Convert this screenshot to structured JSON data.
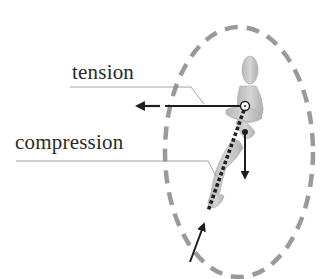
{
  "diagram": {
    "labels": {
      "tension": "tension",
      "compression": "compression"
    },
    "figure": "wooden-mannequin-leg",
    "colors": {
      "ellipse": "#9a9a9a",
      "lines": "#1e1e1e",
      "leader": "#8a8a8a",
      "figure": "#c9c9c9"
    }
  }
}
